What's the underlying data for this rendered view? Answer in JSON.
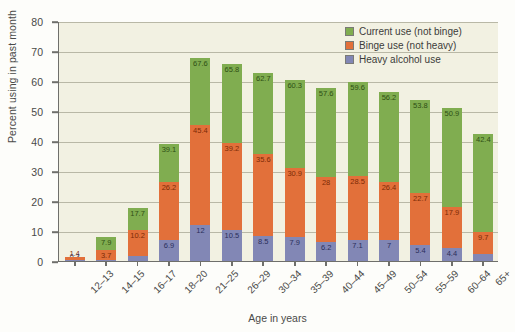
{
  "chart_data": {
    "type": "bar",
    "subtype": "stacked-bar",
    "title": "",
    "xlabel": "Age in years",
    "ylabel": "Percent using in past month",
    "ylim": [
      0,
      80
    ],
    "ytick_step": 10,
    "yticks": [
      "0",
      "10",
      "20",
      "30",
      "40",
      "50",
      "60",
      "70",
      "80"
    ],
    "grid": "horizontal",
    "legend_position": "top-right",
    "categories": [
      "12–13",
      "14–15",
      "16–17",
      "18–20",
      "21–25",
      "26–29",
      "30–34",
      "35–39",
      "40–44",
      "45–49",
      "50–54",
      "55–59",
      "60–64",
      "65+"
    ],
    "series": [
      {
        "name": "Heavy alcohol use",
        "color": "#8287b5",
        "values": [
          0.3,
          0.5,
          1.7,
          6.9,
          12,
          10.5,
          8.5,
          7.9,
          6.2,
          7.1,
          7,
          5.4,
          4.4,
          2.3
        ],
        "labels": [
          "0.3",
          "0.5",
          "1.7",
          "6.9",
          "12",
          "10.5",
          "8.5",
          "7.9",
          "6.2",
          "7.1",
          "7",
          "5.4",
          "4.4",
          "2.3"
        ]
      },
      {
        "name": "Binge use (not heavy)",
        "color": "#e2703a",
        "values": [
          1.4,
          3.7,
          10.2,
          26.2,
          45.4,
          39.2,
          35.6,
          30.9,
          28,
          28.5,
          26.4,
          22.7,
          17.9,
          9.7
        ],
        "labels": [
          "1.4",
          "3.7",
          "10.2",
          "26.2",
          "45.4",
          "39.2",
          "35.6",
          "30.9",
          "28",
          "28.5",
          "26.4",
          "22.7",
          "17.9",
          "9.7"
        ]
      },
      {
        "name": "Current use (not binge)",
        "color": "#80ad50",
        "values": [
          null,
          7.9,
          17.7,
          39.1,
          67.6,
          65.8,
          62.7,
          60.3,
          57.6,
          59.6,
          56.2,
          53.8,
          50.9,
          42.4
        ],
        "labels": [
          "",
          "7.9",
          "17.7",
          "39.1",
          "67.6",
          "65.8",
          "62.7",
          "60.3",
          "57.6",
          "59.6",
          "56.2",
          "53.8",
          "50.9",
          "42.4"
        ]
      }
    ],
    "legend": [
      {
        "label": "Current use (not binge)",
        "color": "#80ad50"
      },
      {
        "label": "Binge use (not heavy)",
        "color": "#e2703a"
      },
      {
        "label": "Heavy alcohol use",
        "color": "#8287b5"
      }
    ],
    "note": "Values are cumulative tops: heavy <= binge <= current"
  }
}
